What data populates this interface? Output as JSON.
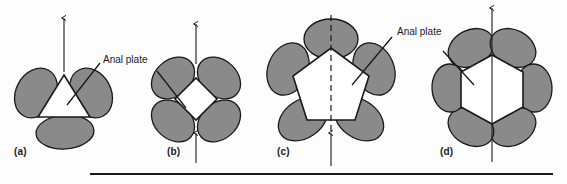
{
  "figure": {
    "background_color": "#fdfdfd",
    "plate_fill_color": "#8a8a8a",
    "plate_stroke_color": "#1a1a1a",
    "anal_plate_fill_color": "#ffffff",
    "line_color": "#1a1a1a",
    "text_color": "#1a1a1a"
  },
  "callouts": [
    {
      "name": "callout-a-b",
      "text": "Anal plate",
      "x": 103,
      "y": 60
    },
    {
      "name": "callout-c-d",
      "text": "Anal plate",
      "x": 397,
      "y": 32
    }
  ],
  "panels": [
    {
      "id": "a",
      "label": "(a)",
      "label_x": 14,
      "label_y": 152,
      "plate_count": 3,
      "anal_plate_shape": "triangle",
      "anal_plate_sides": 3,
      "center_x": 64,
      "center_y": 97,
      "arrows": [
        {
          "name": "arrow-up-top",
          "direction": "up",
          "style": "solid",
          "x": 64,
          "y_top": 18,
          "y_bottom": 72
        }
      ],
      "axis_line": "none"
    },
    {
      "id": "b",
      "label": "(b)",
      "label_x": 167,
      "label_y": 152,
      "plate_count": 4,
      "anal_plate_shape": "diamond",
      "anal_plate_sides": 4,
      "center_x": 196,
      "center_y": 99,
      "arrows": [
        {
          "name": "arrow-up-top",
          "direction": "up",
          "style": "solid",
          "x": 196,
          "y_top": 24,
          "y_bottom": 64
        },
        {
          "name": "arrow-up-bottom",
          "direction": "up",
          "style": "solid",
          "x": 196,
          "y_top": 133,
          "y_bottom": 163
        }
      ],
      "axis_line": "none"
    },
    {
      "id": "c",
      "label": "(c)",
      "label_x": 277,
      "label_y": 152,
      "plate_count": 5,
      "anal_plate_shape": "pentagon",
      "anal_plate_sides": 5,
      "center_x": 331,
      "center_y": 82,
      "arrows": [
        {
          "name": "arrow-up-bottom",
          "direction": "up",
          "style": "solid",
          "x": 331,
          "y_top": 133,
          "y_bottom": 166
        }
      ],
      "axis_line": "dashed"
    },
    {
      "id": "d",
      "label": "(d)",
      "label_x": 440,
      "label_y": 152,
      "plate_count": 6,
      "anal_plate_shape": "hexagon",
      "anal_plate_sides": 6,
      "center_x": 492,
      "center_y": 88,
      "arrows": [
        {
          "name": "arrow-up-through",
          "direction": "up",
          "style": "solid",
          "x": 492,
          "y_top": 8,
          "y_bottom": 162
        }
      ],
      "axis_line": "none"
    }
  ],
  "caption_rule": {
    "name": "caption-rule",
    "x": 90,
    "y": 173,
    "width": 463,
    "height": 2
  }
}
